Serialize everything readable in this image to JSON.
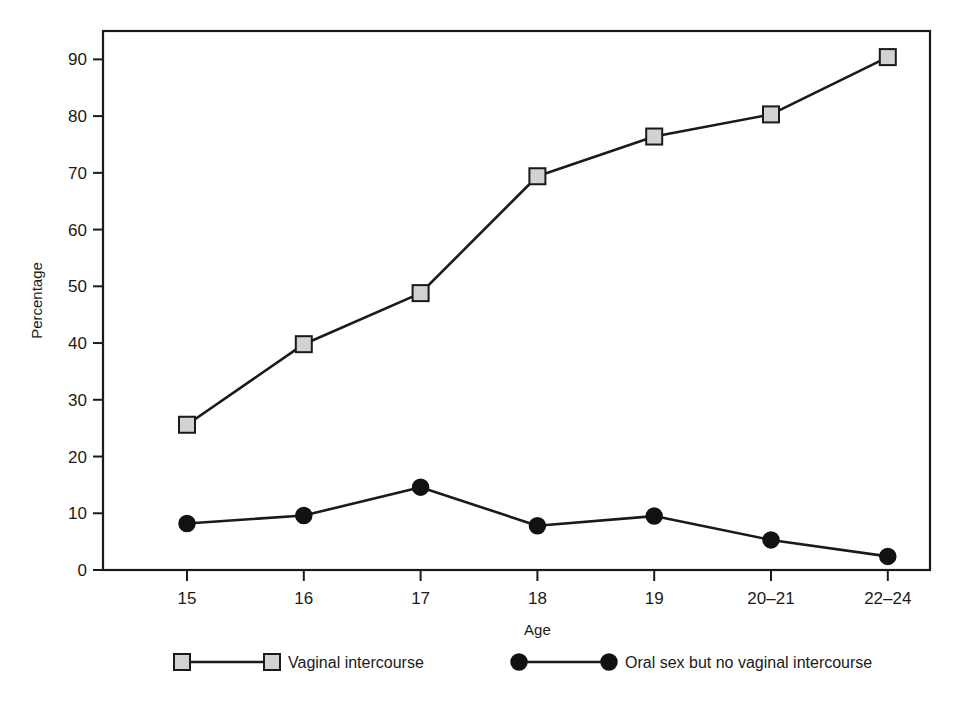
{
  "chart_data": {
    "type": "line",
    "title": "",
    "xlabel": "Age",
    "ylabel": "Percentage",
    "categories": [
      "15",
      "16",
      "17",
      "18",
      "19",
      "20–21",
      "22–24"
    ],
    "ylim": [
      0,
      95
    ],
    "yticks": [
      0,
      10,
      20,
      30,
      40,
      50,
      60,
      70,
      80,
      90
    ],
    "ytick_labels": [
      "0",
      "10",
      "20",
      "30",
      "40",
      "50",
      "60",
      "70",
      "80",
      "90"
    ],
    "grid": false,
    "legend_position": "bottom",
    "series": [
      {
        "name": "Vaginal intercourse",
        "marker": "square",
        "marker_fill": "#d2d2d2",
        "marker_stroke": "#1a1a1a",
        "line_color": "#1a1a1a",
        "values": [
          25.6,
          39.8,
          48.8,
          69.4,
          76.4,
          80.3,
          90.4
        ]
      },
      {
        "name": "Oral sex but no vaginal intercourse",
        "marker": "circle",
        "marker_fill": "#111111",
        "marker_stroke": "#111111",
        "line_color": "#1a1a1a",
        "values": [
          8.2,
          9.6,
          14.6,
          7.8,
          9.5,
          5.3,
          2.4
        ]
      }
    ]
  },
  "legend": {
    "items": [
      {
        "label": "Vaginal intercourse",
        "marker": "square-marker"
      },
      {
        "label": "Oral sex but no vaginal intercourse",
        "marker": "circle-marker"
      }
    ]
  },
  "colors": {
    "background": "#ffffff",
    "frame": "#1a1a1a",
    "line": "#1a1a1a",
    "square_fill": "#d2d2d2",
    "circle_fill": "#111111"
  }
}
